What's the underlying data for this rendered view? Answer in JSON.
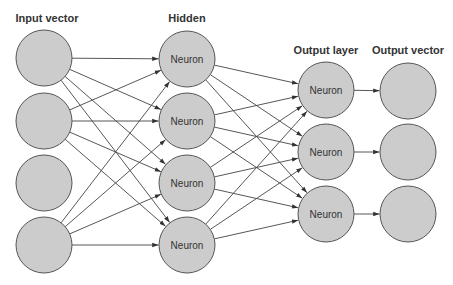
{
  "diagram": {
    "type": "neural-network",
    "colors": {
      "node_fill": "#cccccc",
      "node_stroke": "#555555",
      "edge": "#444444",
      "text": "#333333",
      "background": "#ffffff"
    },
    "layers": [
      {
        "id": "input",
        "title": "Input vector",
        "title_pos": [
          47,
          22
        ],
        "nodes": [
          {
            "cx": 44,
            "cy": 58,
            "label": ""
          },
          {
            "cx": 44,
            "cy": 121,
            "label": ""
          },
          {
            "cx": 44,
            "cy": 183,
            "label": ""
          },
          {
            "cx": 44,
            "cy": 245,
            "label": ""
          }
        ]
      },
      {
        "id": "hidden",
        "title": "Hidden",
        "title_pos": [
          187,
          22
        ],
        "nodes": [
          {
            "cx": 187,
            "cy": 59,
            "label": "Neuron"
          },
          {
            "cx": 187,
            "cy": 121,
            "label": "Neuron"
          },
          {
            "cx": 187,
            "cy": 183,
            "label": "Neuron"
          },
          {
            "cx": 187,
            "cy": 245,
            "label": "Neuron"
          }
        ]
      },
      {
        "id": "output_layer",
        "title": "Output layer",
        "title_pos": [
          326,
          54
        ],
        "nodes": [
          {
            "cx": 326,
            "cy": 90,
            "label": "Neuron"
          },
          {
            "cx": 326,
            "cy": 152,
            "label": "Neuron"
          },
          {
            "cx": 326,
            "cy": 214,
            "label": "Neuron"
          }
        ]
      },
      {
        "id": "output_vector",
        "title": "Output vector",
        "title_pos": [
          408,
          54
        ],
        "nodes": [
          {
            "cx": 408,
            "cy": 91,
            "label": ""
          },
          {
            "cx": 408,
            "cy": 152,
            "label": ""
          },
          {
            "cx": 408,
            "cy": 214,
            "label": ""
          }
        ]
      }
    ],
    "node_radius": 28,
    "connections": [
      {
        "from": "input",
        "to": "hidden",
        "mode": "full"
      },
      {
        "from": "hidden",
        "to": "output_layer",
        "mode": "full"
      },
      {
        "from": "output_layer",
        "to": "output_vector",
        "mode": "one-to-one"
      }
    ],
    "excluded_sources": {
      "input": [
        2
      ]
    }
  }
}
